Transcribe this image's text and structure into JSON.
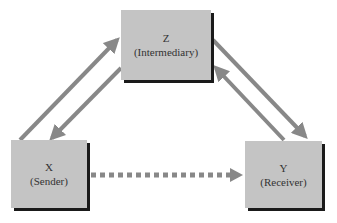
{
  "nodes": {
    "z": {
      "letter": "Z",
      "role": "(Intermediary)"
    },
    "x": {
      "letter": "X",
      "role": "(Sender)"
    },
    "y": {
      "letter": "Y",
      "role": "(Receiver)"
    }
  },
  "colors": {
    "box_fill": "#c4c4c4",
    "box_shadow": "#1a1a1a",
    "arrow": "#888888"
  },
  "edges": [
    {
      "from": "X",
      "to": "Z",
      "style": "solid"
    },
    {
      "from": "Z",
      "to": "X",
      "style": "solid"
    },
    {
      "from": "Z",
      "to": "Y",
      "style": "solid"
    },
    {
      "from": "Y",
      "to": "Z",
      "style": "solid"
    },
    {
      "from": "X",
      "to": "Y",
      "style": "dashed"
    }
  ]
}
